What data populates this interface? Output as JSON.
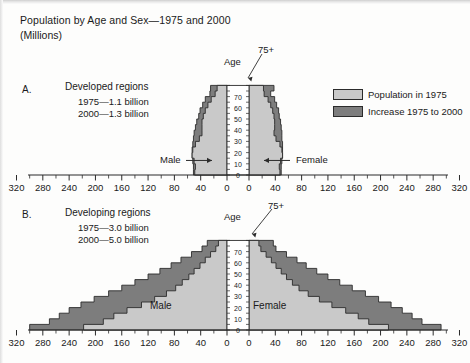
{
  "title": {
    "line1": "Population by Age and Sex—1975 and 2000",
    "line2": "(Millions)"
  },
  "legend": {
    "items": [
      {
        "label": "Population in 1975",
        "color": "#c9c9c9"
      },
      {
        "label": "Increase 1975 to 2000",
        "color": "#7d7d7d"
      }
    ]
  },
  "axis": {
    "x_ticks": [
      "320",
      "280",
      "240",
      "200",
      "160",
      "120",
      "80",
      "40",
      "0",
      "0",
      "40",
      "80",
      "120",
      "160",
      "200",
      "240",
      "280",
      "320"
    ],
    "age_label": "Age",
    "age_ticks": [
      "0",
      "10",
      "20",
      "30",
      "40",
      "50",
      "60",
      "70"
    ],
    "top_age_label": "75+"
  },
  "panels": [
    {
      "letter": "A.",
      "title": "Developed regions",
      "line1": "1975—1.1 billion",
      "line2": "2000—1.3 billion",
      "male_label": "Male",
      "female_label": "Female",
      "labels_inside": false
    },
    {
      "letter": "B.",
      "title": "Developing regions",
      "line1": "1975—3.0 billion",
      "line2": "2000—5.0 billion",
      "male_label": "Male",
      "female_label": "Female",
      "labels_inside": true
    }
  ],
  "chart_data": {
    "type": "bar",
    "subtitle": "(Millions)",
    "orientation": "horizontal-pyramid",
    "xlabel": "",
    "ylabel": "Age",
    "xlim": [
      -320,
      320
    ],
    "xtick_values": [
      -320,
      -280,
      -240,
      -200,
      -160,
      -120,
      -80,
      -40,
      0,
      0,
      40,
      80,
      120,
      160,
      200,
      240,
      280,
      320
    ],
    "grid": false,
    "legend_position": "right",
    "age_groups": [
      "0-4",
      "5-9",
      "10-14",
      "15-19",
      "20-24",
      "25-29",
      "30-34",
      "35-39",
      "40-44",
      "45-49",
      "50-54",
      "55-59",
      "60-64",
      "65-69",
      "70-74",
      "75+"
    ],
    "panels": [
      {
        "name": "A. Developed regions",
        "total_1975_billion": 1.1,
        "total_2000_billion": 1.3,
        "series": [
          {
            "name": "Population in 1975",
            "sex": "Male",
            "values": [
              49,
              48,
              50,
              53,
              52,
              48,
              42,
              38,
              38,
              38,
              36,
              33,
              29,
              24,
              18,
              15
            ]
          },
          {
            "name": "Increase 1975 to 2000",
            "sex": "Male",
            "values": [
              2,
              3,
              2,
              0,
              1,
              4,
              9,
              12,
              10,
              8,
              7,
              8,
              8,
              9,
              8,
              10
            ]
          },
          {
            "name": "Population in 1975",
            "sex": "Female",
            "values": [
              47,
              46,
              48,
              51,
              50,
              47,
              41,
              38,
              39,
              39,
              38,
              36,
              33,
              29,
              23,
              22
            ]
          },
          {
            "name": "Increase 1975 to 2000",
            "sex": "Female",
            "values": [
              2,
              3,
              2,
              0,
              1,
              4,
              9,
              12,
              10,
              9,
              8,
              9,
              9,
              10,
              10,
              16
            ]
          }
        ]
      },
      {
        "name": "B. Developing regions",
        "total_1975_billion": 3.0,
        "total_2000_billion": 5.0,
        "series": [
          {
            "name": "Population in 1975",
            "sex": "Male",
            "values": [
              218,
              188,
              172,
              152,
              130,
              110,
              92,
              78,
              68,
              58,
              50,
              41,
              33,
              25,
              17,
              13
            ]
          },
          {
            "name": "Increase 1975 to 2000",
            "sex": "Male",
            "values": [
              82,
              82,
              83,
              88,
              92,
              92,
              88,
              82,
              72,
              62,
              52,
              44,
              37,
              29,
              21,
              17
            ]
          },
          {
            "name": "Population in 1975",
            "sex": "Female",
            "values": [
              212,
              182,
              166,
              147,
              126,
              107,
              90,
              76,
              66,
              57,
              49,
              41,
              34,
              26,
              18,
              15
            ]
          },
          {
            "name": "Increase 1975 to 2000",
            "sex": "Female",
            "values": [
              80,
              81,
              82,
              86,
              90,
              90,
              87,
              81,
              72,
              63,
              54,
              46,
              39,
              31,
              23,
              22
            ]
          }
        ]
      }
    ]
  }
}
